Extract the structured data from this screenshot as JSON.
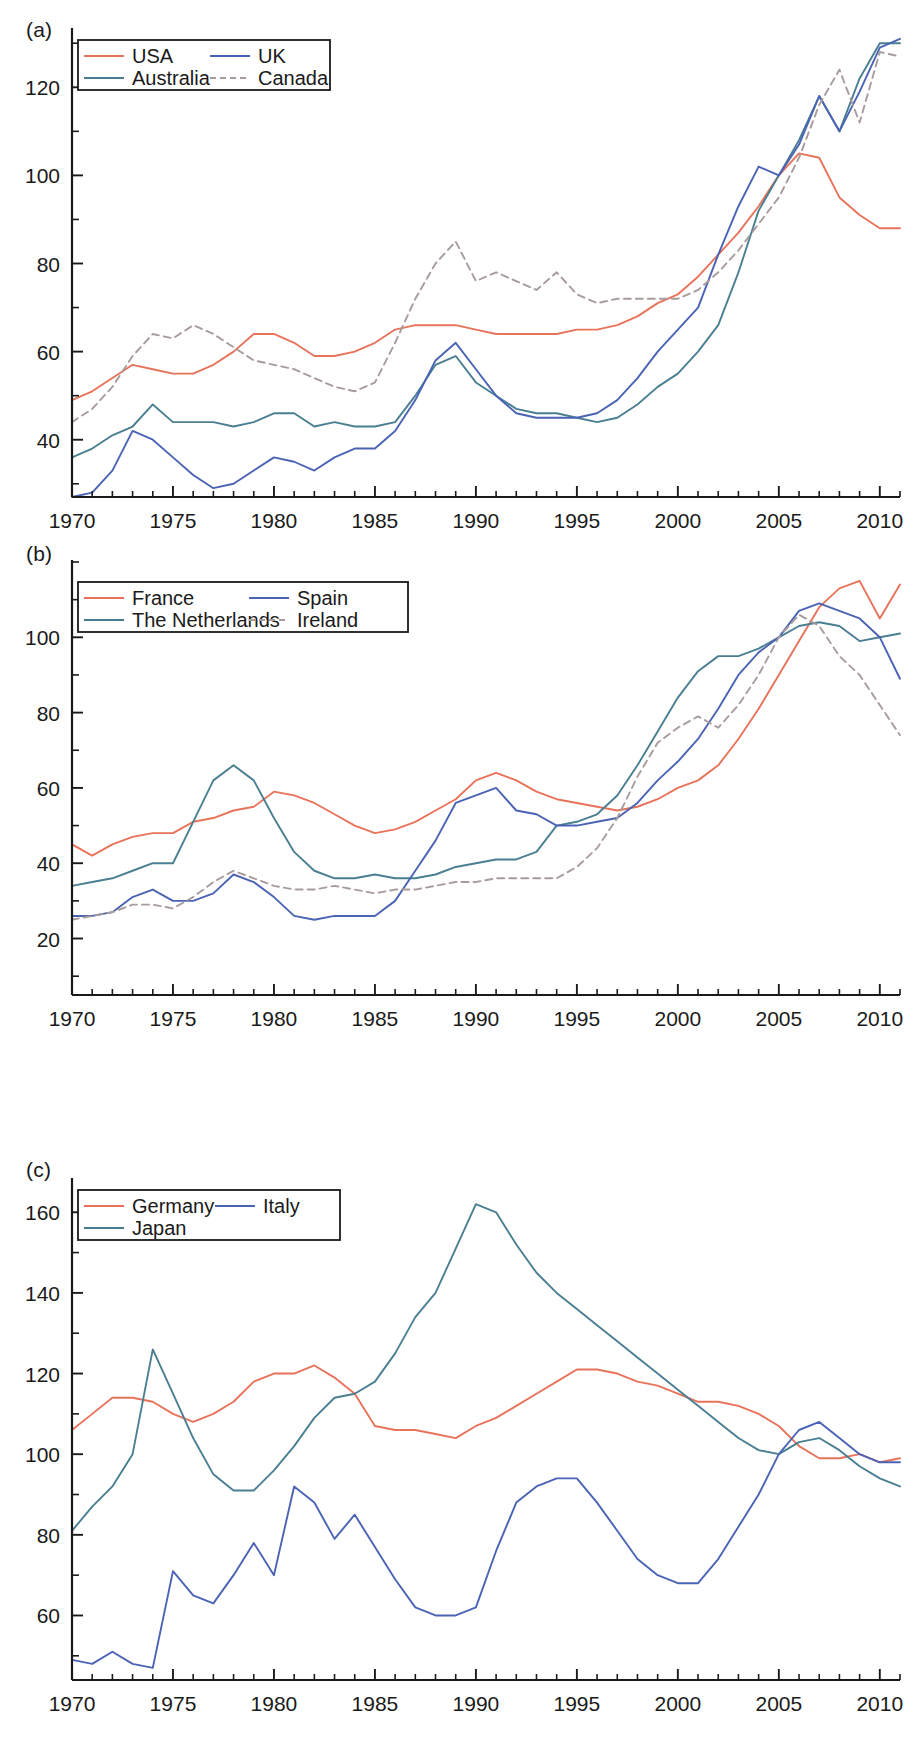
{
  "figure": {
    "panels": [
      {
        "key": "a",
        "label": "(a)"
      },
      {
        "key": "b",
        "label": "(b)"
      },
      {
        "key": "c",
        "label": "(c)"
      }
    ]
  },
  "colors": {
    "red": "#e8735a",
    "blue": "#4a63b4",
    "teal": "#4a7f92",
    "dashed_gray": "#a89b9b",
    "axis": "#1a1a1a"
  },
  "chart_data": [
    {
      "type": "line",
      "panel": "(a)",
      "title": "",
      "xlabel": "",
      "ylabel": "",
      "xlim": [
        1970,
        2011
      ],
      "ylim": [
        27,
        133
      ],
      "xticks": [
        1970,
        1975,
        1980,
        1985,
        1990,
        1995,
        2000,
        2005,
        2010
      ],
      "yticks": [
        40,
        60,
        80,
        100,
        120
      ],
      "xtick_labels": [
        "1970",
        "1975",
        "1980",
        "1985",
        "1990",
        "1995",
        "2000",
        "2005",
        "2010"
      ],
      "ytick_labels": [
        "40",
        "60",
        "80",
        "100",
        "120"
      ],
      "grid": false,
      "legend_position": "top-left",
      "x": [
        1970,
        1971,
        1972,
        1973,
        1974,
        1975,
        1976,
        1977,
        1978,
        1979,
        1980,
        1981,
        1982,
        1983,
        1984,
        1985,
        1986,
        1987,
        1988,
        1989,
        1990,
        1991,
        1992,
        1993,
        1994,
        1995,
        1996,
        1997,
        1998,
        1999,
        2000,
        2001,
        2002,
        2003,
        2004,
        2005,
        2006,
        2007,
        2008,
        2009,
        2010,
        2011
      ],
      "series": [
        {
          "name": "USA",
          "color": "#e8735a",
          "style": "solid",
          "values": [
            49,
            51,
            54,
            57,
            56,
            55,
            55,
            57,
            60,
            64,
            64,
            62,
            59,
            59,
            60,
            62,
            65,
            66,
            66,
            66,
            65,
            64,
            64,
            64,
            64,
            65,
            65,
            66,
            68,
            71,
            73,
            77,
            82,
            87,
            93,
            100,
            105,
            104,
            95,
            91,
            88,
            88
          ]
        },
        {
          "name": "Australia",
          "color": "#4a7f92",
          "style": "solid",
          "values": [
            36,
            38,
            41,
            43,
            48,
            44,
            44,
            44,
            43,
            44,
            46,
            46,
            43,
            44,
            43,
            43,
            44,
            50,
            57,
            59,
            53,
            50,
            47,
            46,
            46,
            45,
            44,
            45,
            48,
            52,
            55,
            60,
            66,
            78,
            92,
            100,
            108,
            118,
            110,
            122,
            130,
            130
          ]
        },
        {
          "name": "UK",
          "color": "#4a63b4",
          "style": "solid",
          "values": [
            27,
            28,
            33,
            42,
            40,
            36,
            32,
            29,
            30,
            33,
            36,
            35,
            33,
            36,
            38,
            38,
            42,
            49,
            58,
            62,
            56,
            50,
            46,
            45,
            45,
            45,
            46,
            49,
            54,
            60,
            65,
            70,
            82,
            93,
            102,
            100,
            107,
            118,
            110,
            119,
            129,
            131
          ]
        },
        {
          "name": "Canada",
          "color": "#a89b9b",
          "style": "dashed",
          "values": [
            44,
            47,
            52,
            59,
            64,
            63,
            66,
            64,
            61,
            58,
            57,
            56,
            54,
            52,
            51,
            53,
            62,
            72,
            80,
            85,
            76,
            78,
            76,
            74,
            78,
            73,
            71,
            72,
            72,
            72,
            72,
            74,
            78,
            83,
            89,
            95,
            104,
            116,
            124,
            112,
            128,
            127
          ]
        }
      ]
    },
    {
      "type": "line",
      "panel": "(b)",
      "title": "",
      "xlabel": "",
      "ylabel": "",
      "xlim": [
        1970,
        2011
      ],
      "ylim": [
        5,
        120
      ],
      "xticks": [
        1970,
        1975,
        1980,
        1985,
        1990,
        1995,
        2000,
        2005,
        2010
      ],
      "yticks": [
        20,
        40,
        60,
        80,
        100
      ],
      "xtick_labels": [
        "1970",
        "1975",
        "1980",
        "1985",
        "1990",
        "1995",
        "2000",
        "2005",
        "2010"
      ],
      "ytick_labels": [
        "20",
        "40",
        "60",
        "80",
        "100"
      ],
      "grid": false,
      "legend_position": "top-left",
      "x": [
        1970,
        1971,
        1972,
        1973,
        1974,
        1975,
        1976,
        1977,
        1978,
        1979,
        1980,
        1981,
        1982,
        1983,
        1984,
        1985,
        1986,
        1987,
        1988,
        1989,
        1990,
        1991,
        1992,
        1993,
        1994,
        1995,
        1996,
        1997,
        1998,
        1999,
        2000,
        2001,
        2002,
        2003,
        2004,
        2005,
        2006,
        2007,
        2008,
        2009,
        2010,
        2011
      ],
      "series": [
        {
          "name": "France",
          "color": "#e8735a",
          "style": "solid",
          "values": [
            45,
            42,
            45,
            47,
            48,
            48,
            51,
            52,
            54,
            55,
            59,
            58,
            56,
            53,
            50,
            48,
            49,
            51,
            54,
            57,
            62,
            64,
            62,
            59,
            57,
            56,
            55,
            54,
            55,
            57,
            60,
            62,
            66,
            73,
            81,
            90,
            99,
            108,
            113,
            115,
            105,
            114
          ]
        },
        {
          "name": "The Netherlands",
          "color": "#4a7f92",
          "style": "solid",
          "values": [
            34,
            35,
            36,
            38,
            40,
            40,
            51,
            62,
            66,
            62,
            52,
            43,
            38,
            36,
            36,
            37,
            36,
            36,
            37,
            39,
            40,
            41,
            41,
            43,
            50,
            51,
            53,
            58,
            66,
            75,
            84,
            91,
            95,
            95,
            97,
            100,
            103,
            104,
            103,
            99,
            100,
            101
          ]
        },
        {
          "name": "Spain",
          "color": "#4a63b4",
          "style": "solid",
          "values": [
            26,
            26,
            27,
            31,
            33,
            30,
            30,
            32,
            37,
            35,
            31,
            26,
            25,
            26,
            26,
            26,
            30,
            38,
            46,
            56,
            58,
            60,
            54,
            53,
            50,
            50,
            51,
            52,
            56,
            62,
            67,
            73,
            81,
            90,
            96,
            100,
            107,
            109,
            107,
            105,
            100,
            89
          ]
        },
        {
          "name": "Ireland",
          "color": "#a89b9b",
          "style": "dashed",
          "values": [
            25,
            26,
            27,
            29,
            29,
            28,
            31,
            35,
            38,
            36,
            34,
            33,
            33,
            34,
            33,
            32,
            33,
            33,
            34,
            35,
            35,
            36,
            36,
            36,
            36,
            39,
            44,
            52,
            63,
            72,
            76,
            79,
            76,
            82,
            90,
            100,
            106,
            103,
            95,
            90,
            82,
            74
          ]
        }
      ]
    },
    {
      "type": "line",
      "panel": "(c)",
      "title": "",
      "xlabel": "",
      "ylabel": "",
      "xlim": [
        1970,
        2011
      ],
      "ylim": [
        44,
        168
      ],
      "xticks": [
        1970,
        1975,
        1980,
        1985,
        1990,
        1995,
        2000,
        2005,
        2010
      ],
      "yticks": [
        60,
        80,
        100,
        120,
        140,
        160
      ],
      "xtick_labels": [
        "1970",
        "1975",
        "1980",
        "1985",
        "1990",
        "1995",
        "2000",
        "2005",
        "2010"
      ],
      "ytick_labels": [
        "60",
        "80",
        "100",
        "120",
        "140",
        "160"
      ],
      "grid": false,
      "legend_position": "top-left",
      "x": [
        1970,
        1971,
        1972,
        1973,
        1974,
        1975,
        1976,
        1977,
        1978,
        1979,
        1980,
        1981,
        1982,
        1983,
        1984,
        1985,
        1986,
        1987,
        1988,
        1989,
        1990,
        1991,
        1992,
        1993,
        1994,
        1995,
        1996,
        1997,
        1998,
        1999,
        2000,
        2001,
        2002,
        2003,
        2004,
        2005,
        2006,
        2007,
        2008,
        2009,
        2010,
        2011
      ],
      "series": [
        {
          "name": "Germany",
          "color": "#e8735a",
          "style": "solid",
          "values": [
            106,
            110,
            114,
            114,
            113,
            110,
            108,
            110,
            113,
            118,
            120,
            120,
            122,
            119,
            115,
            107,
            106,
            106,
            105,
            104,
            107,
            109,
            112,
            115,
            118,
            121,
            121,
            120,
            118,
            117,
            115,
            113,
            113,
            112,
            110,
            107,
            102,
            99,
            99,
            100,
            98,
            99
          ]
        },
        {
          "name": "Japan",
          "color": "#4a7f92",
          "style": "solid",
          "values": [
            81,
            87,
            92,
            100,
            126,
            115,
            104,
            95,
            91,
            91,
            96,
            102,
            109,
            114,
            115,
            118,
            125,
            134,
            140,
            151,
            162,
            160,
            152,
            145,
            140,
            136,
            132,
            128,
            124,
            120,
            116,
            112,
            108,
            104,
            101,
            100,
            103,
            104,
            101,
            97,
            94,
            92
          ]
        },
        {
          "name": "Italy",
          "color": "#4a63b4",
          "style": "solid",
          "values": [
            49,
            48,
            51,
            48,
            47,
            71,
            65,
            63,
            70,
            78,
            70,
            92,
            88,
            79,
            85,
            77,
            69,
            62,
            60,
            60,
            62,
            76,
            88,
            92,
            94,
            94,
            88,
            81,
            74,
            70,
            68,
            68,
            74,
            82,
            90,
            100,
            106,
            108,
            104,
            100,
            98,
            98
          ]
        }
      ]
    }
  ]
}
